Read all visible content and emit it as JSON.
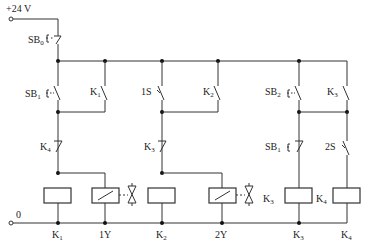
{
  "diagram": {
    "type": "relay ladder circuit",
    "supply": {
      "positive_label": "+24 V",
      "zero_label": "0"
    },
    "stop_button": {
      "label": "SB",
      "sub": "0",
      "type": "NC pushbutton"
    },
    "rungs": [
      {
        "id": "rung-1",
        "start": {
          "label": "SB",
          "sub": "1",
          "type": "NO pushbutton"
        },
        "hold": {
          "label": "K",
          "sub": "1",
          "type": "NO contact"
        },
        "interlock": {
          "label": "K",
          "sub": "4",
          "type": "NC contact"
        },
        "coil": {
          "label": "K",
          "sub": "1"
        },
        "solenoid": {
          "label": "1Y"
        }
      },
      {
        "id": "rung-2",
        "start": {
          "label": "1S",
          "sub": "",
          "type": "limit switch NO"
        },
        "hold": {
          "label": "K",
          "sub": "2",
          "type": "NO contact"
        },
        "interlock": {
          "label": "K",
          "sub": "3",
          "type": "NC contact"
        },
        "coil": {
          "label": "K",
          "sub": "2"
        },
        "solenoid": {
          "label": "2Y"
        }
      },
      {
        "id": "rung-3",
        "start": {
          "label": "SB",
          "sub": "2",
          "type": "NO pushbutton"
        },
        "hold": {
          "label": "K",
          "sub": "3",
          "type": "NO contact"
        },
        "interlock": {
          "label": "SB",
          "sub": "1",
          "type": "NC pushbutton"
        },
        "coil": {
          "label": "K",
          "sub": "3"
        },
        "side_label": {
          "label": "K",
          "sub": "3"
        }
      },
      {
        "id": "rung-4",
        "switch": {
          "label": "2S",
          "sub": "",
          "type": "limit switch NO"
        },
        "coil": {
          "label": "K",
          "sub": "4"
        },
        "side_label": {
          "label": "K",
          "sub": "4"
        }
      }
    ],
    "bottom_labels": [
      {
        "label": "K",
        "sub": "1"
      },
      {
        "label": "1Y",
        "sub": ""
      },
      {
        "label": "K",
        "sub": "2"
      },
      {
        "label": "2Y",
        "sub": ""
      },
      {
        "label": "K",
        "sub": "3"
      },
      {
        "label": "K",
        "sub": "4"
      }
    ]
  }
}
